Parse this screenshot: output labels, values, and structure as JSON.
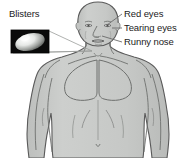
{
  "diagram": {
    "title_visible": false,
    "background_color": "#ffffff",
    "body_fill_color": "#c9cbc9",
    "body_outline_color": "#5a5a5a",
    "leader_line_color": "#6b6b6b",
    "text_color": "#1b1b1b"
  },
  "labels": {
    "blisters": "Blisters",
    "red_eyes": "Red eyes",
    "tearing_eyes": "Tearing eyes",
    "runny_nose": "Runny nose"
  },
  "inset": {
    "name": "blister-photo-inset",
    "background_color": "#0a0a0a",
    "blister_color": "#d8dad8",
    "border_color": "#000000"
  },
  "annotations": [
    {
      "label": "Blisters",
      "target": "neck-shoulder",
      "side": "left"
    },
    {
      "label": "Red eyes",
      "target": "eye",
      "side": "right"
    },
    {
      "label": "Tearing eyes",
      "target": "eye-corner",
      "side": "right"
    },
    {
      "label": "Runny nose",
      "target": "nose",
      "side": "right"
    }
  ]
}
